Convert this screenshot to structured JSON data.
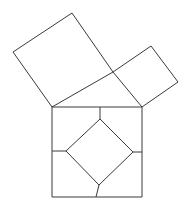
{
  "figure": {
    "background_color": "#ffffff",
    "stroke_color": "#3a3a3a",
    "stroke_width": 1,
    "canvas": {
      "width": 188,
      "height": 212
    }
  },
  "geometry": {
    "triangle": {
      "name": "right-triangle",
      "vertices": [
        {
          "label": "A",
          "x": 52,
          "y": 107
        },
        {
          "label": "B",
          "x": 142,
          "y": 107
        },
        {
          "label": "C",
          "x": 113,
          "y": 72
        }
      ]
    },
    "hypotenuse_square": {
      "name": "square-on-hypotenuse",
      "points": "52,107 142,107 142,197 52,197",
      "side_length": 90
    },
    "leg_square_large": {
      "name": "square-on-long-leg",
      "points": "52,107 13,52 72,13 113,72",
      "side_length": 67
    },
    "leg_square_small": {
      "name": "square-on-short-leg",
      "points": "113,72 151,46 178,82 142,107",
      "side_length": 46
    },
    "inner_square": {
      "name": "inner-tilted-square",
      "points": "100,119 133,152 99,185 66,151",
      "side_length": 47
    },
    "dissection_cuts": [
      {
        "name": "cut-top",
        "x1": 100,
        "y1": 107,
        "x2": 100,
        "y2": 119
      },
      {
        "name": "cut-right",
        "x1": 142,
        "y1": 152,
        "x2": 133,
        "y2": 152
      },
      {
        "name": "cut-bottom",
        "x1": 96,
        "y1": 197,
        "x2": 99,
        "y2": 185
      },
      {
        "name": "cut-left",
        "x1": 52,
        "y1": 151,
        "x2": 66,
        "y2": 151
      }
    ]
  }
}
